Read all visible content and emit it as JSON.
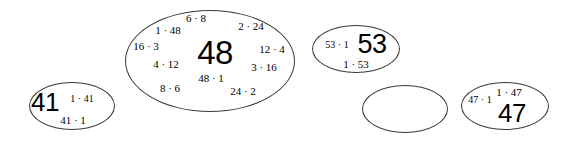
{
  "canvas": {
    "width": 570,
    "height": 148,
    "background": "#ffffff",
    "stroke_color": "#3a3a3a",
    "text_color": "#000000"
  },
  "diagram": {
    "type": "factor-pair-bubble-cloud",
    "bubbles": [
      {
        "id": "bubble-41",
        "headline": "41",
        "cx": 72,
        "cy": 106,
        "rx": 43,
        "ry": 24,
        "tokens": [
          {
            "text": "41",
            "x": 45,
            "y": 102,
            "size": 26,
            "big": true
          },
          {
            "text": "1 · 41",
            "x": 82,
            "y": 99,
            "size": 10,
            "big": false
          },
          {
            "text": "41 · 1",
            "x": 73,
            "y": 120,
            "size": 11,
            "big": false
          }
        ]
      },
      {
        "id": "bubble-48",
        "headline": "48",
        "cx": 210,
        "cy": 61,
        "rx": 85,
        "ry": 51,
        "tokens": [
          {
            "text": "48",
            "x": 215,
            "y": 52,
            "size": 33,
            "big": true
          },
          {
            "text": "6 · 8",
            "x": 196,
            "y": 18,
            "size": 11,
            "big": false
          },
          {
            "text": "1 · 48",
            "x": 168,
            "y": 30,
            "size": 11,
            "big": false
          },
          {
            "text": "2 · 24",
            "x": 251,
            "y": 26,
            "size": 11,
            "big": false
          },
          {
            "text": "16 · 3",
            "x": 146,
            "y": 46,
            "size": 11,
            "big": false
          },
          {
            "text": "12 · 4",
            "x": 272,
            "y": 49,
            "size": 11,
            "big": false
          },
          {
            "text": "4 · 12",
            "x": 166,
            "y": 64,
            "size": 11,
            "big": false
          },
          {
            "text": "3 · 16",
            "x": 264,
            "y": 67,
            "size": 11,
            "big": false
          },
          {
            "text": "48 · 1",
            "x": 211,
            "y": 78,
            "size": 11,
            "big": false
          },
          {
            "text": "8 · 6",
            "x": 170,
            "y": 88,
            "size": 11,
            "big": false
          },
          {
            "text": "24 · 2",
            "x": 243,
            "y": 91,
            "size": 11,
            "big": false
          }
        ]
      },
      {
        "id": "bubble-53",
        "headline": "53",
        "cx": 356,
        "cy": 49,
        "rx": 44,
        "ry": 24,
        "tokens": [
          {
            "text": "53",
            "x": 372,
            "y": 44,
            "size": 27,
            "big": true
          },
          {
            "text": "53 · 1",
            "x": 337,
            "y": 45,
            "size": 10,
            "big": false
          },
          {
            "text": "1 · 53",
            "x": 356,
            "y": 64,
            "size": 11,
            "big": false
          }
        ]
      },
      {
        "id": "bubble-empty",
        "headline": "",
        "cx": 405,
        "cy": 109,
        "rx": 43,
        "ry": 24,
        "tokens": []
      },
      {
        "id": "bubble-47",
        "headline": "47",
        "cx": 505,
        "cy": 106,
        "rx": 44,
        "ry": 24,
        "tokens": [
          {
            "text": "47",
            "x": 512,
            "y": 113,
            "size": 26,
            "big": true
          },
          {
            "text": "1 · 47",
            "x": 509,
            "y": 92,
            "size": 11,
            "big": false
          },
          {
            "text": "47 · 1",
            "x": 480,
            "y": 100,
            "size": 10,
            "big": false
          }
        ]
      }
    ]
  }
}
